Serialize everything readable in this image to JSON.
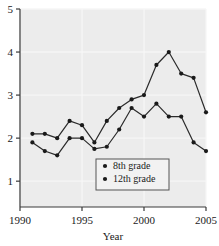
{
  "chart_data": {
    "type": "line",
    "title": "",
    "xlabel": "Year",
    "ylabel": "",
    "x": [
      1991,
      1992,
      1993,
      1994,
      1995,
      1996,
      1997,
      1998,
      1999,
      2000,
      2001,
      2002,
      2003,
      2004,
      2005
    ],
    "xlim": [
      1990,
      2005
    ],
    "ylim": [
      0.4,
      5.0
    ],
    "grid": true,
    "legend_position": "inside-bottom-center",
    "xticks": [
      "1990",
      "1995",
      "2000",
      "2005"
    ],
    "xtick_values": [
      1990,
      1995,
      2000,
      2005
    ],
    "yticks": [
      "1",
      "2",
      "3",
      "4",
      "5"
    ],
    "ytick_values": [
      1,
      2,
      3,
      4,
      5
    ],
    "series": [
      {
        "name": "12th grade",
        "marker": "filled-circle",
        "values": [
          2.1,
          2.1,
          2.0,
          2.4,
          2.3,
          1.9,
          2.4,
          2.7,
          2.9,
          3.0,
          3.7,
          4.0,
          3.5,
          3.4,
          2.6
        ]
      },
      {
        "name": "8th grade",
        "marker": "filled-circle",
        "values": [
          1.9,
          1.7,
          1.6,
          2.0,
          2.0,
          1.75,
          1.8,
          2.2,
          2.7,
          2.5,
          2.8,
          2.5,
          2.5,
          1.9,
          1.7
        ]
      }
    ]
  },
  "legend": {
    "entries": [
      {
        "label": "8th grade",
        "marker": "dot-marker"
      },
      {
        "label": "12th grade",
        "marker": "dot-marker"
      }
    ]
  },
  "axis": {
    "x_title": "Year"
  },
  "colors": {
    "line": "#2b2b2b",
    "marker": "#1a1a1a",
    "plot_background": "#ececec",
    "grid": "#f6f6f6",
    "axis": "#3a3a3a",
    "legend_background": "#f2f2f2",
    "legend_border": "#555555"
  }
}
